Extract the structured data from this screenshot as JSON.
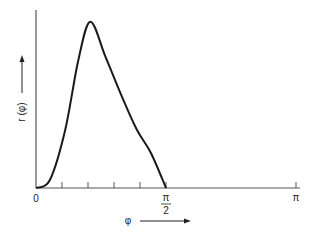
{
  "chart_data": {
    "type": "line",
    "title": "",
    "xlabel": "φ",
    "ylabel": "r (φ)",
    "x_unit": "fraction of π",
    "xlim": [
      0,
      1
    ],
    "ylim": [
      0,
      1.07
    ],
    "grid": false,
    "x_ticks_minor": [
      0.1,
      0.2,
      0.3,
      0.4,
      0.5,
      1.0
    ],
    "tick_labels": {
      "origin": "0",
      "half_pi_num": "π",
      "half_pi_den": "2",
      "pi": "π"
    },
    "series": [
      {
        "name": "r(φ)",
        "x": [
          0,
          0.054,
          0.1125,
          0.163,
          0.209,
          0.267,
          0.333,
          0.388,
          0.442,
          0.5
        ],
        "y": [
          0,
          0.05,
          0.35,
          0.77,
          1.0,
          0.79,
          0.54,
          0.35,
          0.21,
          0
        ]
      }
    ]
  }
}
